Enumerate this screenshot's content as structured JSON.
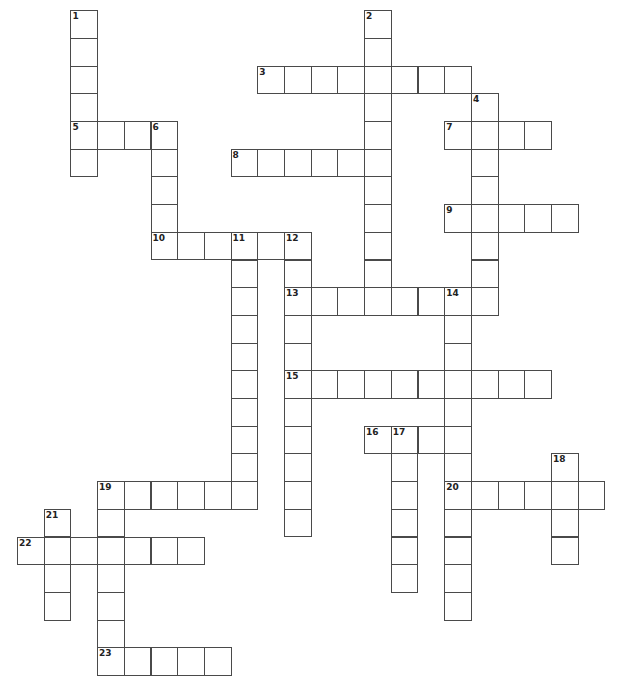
{
  "puzzle": {
    "cell_width": 26.7,
    "cell_height": 27.7,
    "origin_x": 17.5,
    "origin_y": 10.7,
    "border_color": "#4a4a4a",
    "background": "#ffffff"
  },
  "words": [
    {
      "number": "1",
      "direction": "down",
      "row": 0,
      "col": 2,
      "length": 6
    },
    {
      "number": "2",
      "direction": "down",
      "row": 0,
      "col": 13,
      "length": 11
    },
    {
      "number": "3",
      "direction": "across",
      "row": 2,
      "col": 9,
      "length": 8
    },
    {
      "number": "4",
      "direction": "down",
      "row": 3,
      "col": 17,
      "length": 8
    },
    {
      "number": "5",
      "direction": "across",
      "row": 4,
      "col": 2,
      "length": 4
    },
    {
      "number": "6",
      "direction": "down",
      "row": 4,
      "col": 5,
      "length": 5
    },
    {
      "number": "7",
      "direction": "across",
      "row": 4,
      "col": 16,
      "length": 4
    },
    {
      "number": "8",
      "direction": "across",
      "row": 5,
      "col": 8,
      "length": 6
    },
    {
      "number": "9",
      "direction": "across",
      "row": 7,
      "col": 16,
      "length": 5
    },
    {
      "number": "10",
      "direction": "across",
      "row": 8,
      "col": 5,
      "length": 6
    },
    {
      "number": "11",
      "direction": "down",
      "row": 8,
      "col": 8,
      "length": 10
    },
    {
      "number": "12",
      "direction": "down",
      "row": 8,
      "col": 10,
      "length": 11
    },
    {
      "number": "13",
      "direction": "across",
      "row": 10,
      "col": 10,
      "length": 8
    },
    {
      "number": "14",
      "direction": "down",
      "row": 10,
      "col": 16,
      "length": 12
    },
    {
      "number": "15",
      "direction": "across",
      "row": 13,
      "col": 10,
      "length": 10
    },
    {
      "number": "16",
      "direction": "across",
      "row": 15,
      "col": 13,
      "length": 4
    },
    {
      "number": "17",
      "direction": "down",
      "row": 15,
      "col": 14,
      "length": 6
    },
    {
      "number": "18",
      "direction": "down",
      "row": 16,
      "col": 20,
      "length": 4
    },
    {
      "number": "19",
      "direction": "across",
      "row": 17,
      "col": 3,
      "length": 6
    },
    {
      "number": "19",
      "direction": "down",
      "row": 17,
      "col": 3,
      "length": 7
    },
    {
      "number": "20",
      "direction": "across",
      "row": 17,
      "col": 16,
      "length": 6
    },
    {
      "number": "21",
      "direction": "down",
      "row": 18,
      "col": 1,
      "length": 4
    },
    {
      "number": "22",
      "direction": "across",
      "row": 19,
      "col": 0,
      "length": 7
    },
    {
      "number": "23",
      "direction": "across",
      "row": 23,
      "col": 3,
      "length": 5
    }
  ]
}
